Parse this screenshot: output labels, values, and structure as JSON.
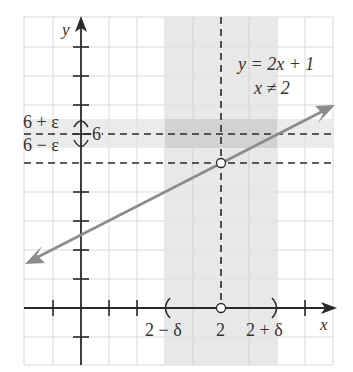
{
  "figure": {
    "type": "epsilon-delta limit diagram",
    "function_label": "y = 2x + 1",
    "domain_label": "x ≠ 2",
    "x_axis_label": "x",
    "y_axis_label": "y",
    "y_value_label": "6",
    "y_upper_label": "6 + ε",
    "y_lower_label": "6 − ε",
    "x_value_label": "2",
    "x_left_label": "2 − δ",
    "x_right_label": "2 + δ",
    "open_point": {
      "x": 2,
      "label": "hole at x = 2"
    },
    "colors": {
      "axis": "#2a2a2a",
      "grid": "#d9d9d9",
      "line": "#8c8c8c",
      "band": "#e4e4e4",
      "band_overlap": "#d2d2d2",
      "dash": "#2a2a2a"
    }
  }
}
